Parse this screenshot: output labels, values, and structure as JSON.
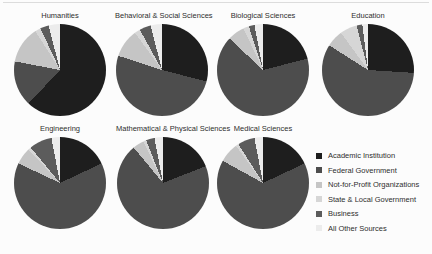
{
  "page": {
    "background_color": "#fcfcfc",
    "description_categories": [
      "Academic Institution",
      "Federal Government",
      "Not-for-Profit Organizations",
      "State & Local Government",
      "Business",
      "All Other Sources"
    ]
  },
  "legend": {
    "position": "bottom-right",
    "items": [
      {
        "label": "Academic Institution",
        "color": "#1e1e1e"
      },
      {
        "label": "Federal Government",
        "color": "#4d4d4d"
      },
      {
        "label": "Not-for-Profit Organizations",
        "color": "#c5c5c5"
      },
      {
        "label": "State & Local Government",
        "color": "#d6d6d6"
      },
      {
        "label": "Business",
        "color": "#5c5c5c"
      },
      {
        "label": "All Other Sources",
        "color": "#ececec"
      }
    ]
  },
  "chart_data": [
    {
      "type": "pie",
      "title": "Humanities",
      "categories": [
        "Academic Institution",
        "Federal Government",
        "Not-for-Profit Organizations",
        "State & Local Government",
        "Business",
        "All Other Sources"
      ],
      "values": [
        62,
        16,
        13,
        2,
        3,
        4
      ],
      "unit": "percent",
      "start_angle_deg": 0,
      "direction": "clockwise"
    },
    {
      "type": "pie",
      "title": "Behavioral & Social Sciences",
      "categories": [
        "Academic Institution",
        "Federal Government",
        "Not-for-Profit Organizations",
        "State & Local Government",
        "Business",
        "All Other Sources"
      ],
      "values": [
        29,
        51,
        10,
        2,
        4,
        4
      ],
      "unit": "percent",
      "start_angle_deg": 0,
      "direction": "clockwise"
    },
    {
      "type": "pie",
      "title": "Biological Sciences",
      "categories": [
        "Academic Institution",
        "Federal Government",
        "Not-for-Profit Organizations",
        "State & Local Government",
        "Business",
        "All Other Sources"
      ],
      "values": [
        21,
        66,
        6,
        2,
        2,
        3
      ],
      "unit": "percent",
      "start_angle_deg": 0,
      "direction": "clockwise"
    },
    {
      "type": "pie",
      "title": "Education",
      "categories": [
        "Academic Institution",
        "Federal Government",
        "Not-for-Profit Organizations",
        "State & Local Government",
        "Business",
        "All Other Sources"
      ],
      "values": [
        26,
        58,
        6,
        6,
        2,
        2
      ],
      "unit": "percent",
      "start_angle_deg": 0,
      "direction": "clockwise"
    },
    {
      "type": "pie",
      "title": "Engineering",
      "categories": [
        "Academic Institution",
        "Federal Government",
        "Not-for-Profit Organizations",
        "State & Local Government",
        "Business",
        "All Other Sources"
      ],
      "values": [
        18,
        64,
        6,
        1,
        8,
        3
      ],
      "unit": "percent",
      "start_angle_deg": 0,
      "direction": "clockwise"
    },
    {
      "type": "pie",
      "title": "Mathematical & Physical Sciences",
      "categories": [
        "Academic Institution",
        "Federal Government",
        "Not-for-Profit Organizations",
        "State & Local Government",
        "Business",
        "All Other Sources"
      ],
      "values": [
        19,
        70,
        4,
        1,
        3,
        3
      ],
      "unit": "percent",
      "start_angle_deg": 0,
      "direction": "clockwise"
    },
    {
      "type": "pie",
      "title": "Medical Sciences",
      "categories": [
        "Academic Institution",
        "Federal Government",
        "Not-for-Profit Organizations",
        "State & Local Government",
        "Business",
        "All Other Sources"
      ],
      "values": [
        18,
        65,
        7,
        1,
        6,
        3
      ],
      "unit": "percent",
      "start_angle_deg": 0,
      "direction": "clockwise"
    }
  ]
}
